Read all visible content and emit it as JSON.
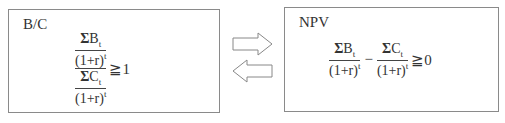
{
  "left_box": {
    "title": "B/C",
    "formula": {
      "numerator": {
        "sum": "Σ",
        "var": "B",
        "sub": "t",
        "denominator_base": "(1+r)",
        "denominator_exp": "t"
      },
      "denominator": {
        "sum": "Σ",
        "var": "C",
        "sub": "t",
        "denominator_base": "(1+r)",
        "denominator_exp": "t"
      },
      "relation": "≧",
      "rhs": "1"
    }
  },
  "right_box": {
    "title": "NPV",
    "formula": {
      "term1": {
        "sum": "Σ",
        "var": "B",
        "sub": "t",
        "denominator_base": "(1+r)",
        "denominator_exp": "t"
      },
      "operator": "−",
      "term2": {
        "sum": "Σ",
        "var": "C",
        "sub": "t",
        "denominator_base": "(1+r)",
        "denominator_exp": "t"
      },
      "relation": "≧",
      "rhs": "0"
    }
  },
  "arrows": [
    {
      "direction": "right"
    },
    {
      "direction": "left"
    }
  ],
  "colors": {
    "border": "#8a8a8a",
    "text": "#333333",
    "arrow_stroke": "#888888"
  }
}
